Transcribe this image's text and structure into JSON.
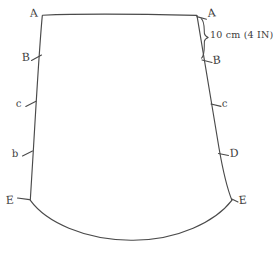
{
  "diagram": {
    "kind": "hand-drawn-pattern-sketch",
    "background_color": "#ffffff",
    "ink_color": "#4a4a4a",
    "labels": {
      "left": [
        {
          "id": "left-a",
          "text": "A",
          "x": 30,
          "y": 17,
          "size": "normal"
        },
        {
          "id": "left-b",
          "text": "B",
          "x": 22,
          "y": 61,
          "size": "normal"
        },
        {
          "id": "left-c",
          "text": "c",
          "x": 16,
          "y": 107,
          "size": "small"
        },
        {
          "id": "left-d",
          "text": "b",
          "x": 12,
          "y": 157,
          "size": "small"
        },
        {
          "id": "left-e",
          "text": "E",
          "x": 6,
          "y": 204,
          "size": "normal"
        }
      ],
      "right": [
        {
          "id": "right-a",
          "text": "A",
          "x": 208,
          "y": 17,
          "size": "normal"
        },
        {
          "id": "right-b",
          "text": "B",
          "x": 213,
          "y": 64,
          "size": "normal"
        },
        {
          "id": "right-c",
          "text": "c",
          "x": 222,
          "y": 107,
          "size": "small"
        },
        {
          "id": "right-d",
          "text": "D",
          "x": 230,
          "y": 157,
          "size": "normal"
        },
        {
          "id": "right-e",
          "text": "E",
          "x": 239,
          "y": 204,
          "size": "normal"
        }
      ]
    },
    "dimension_annotation": {
      "text": "10 cm (4 IN)",
      "value_metric": "10 cm",
      "value_imperial": "4 IN",
      "between_points": "A to B",
      "side": "right",
      "x": 210,
      "y": 38
    },
    "geometry": {
      "top_left": [
        42,
        15
      ],
      "top_right": [
        197,
        15
      ],
      "bottom_left": [
        30,
        200
      ],
      "bottom_right": [
        232,
        200
      ],
      "curve_low_point": [
        131,
        240
      ]
    }
  }
}
